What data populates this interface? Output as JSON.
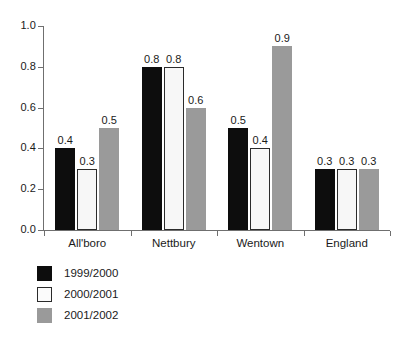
{
  "chart_data": {
    "type": "bar",
    "title": "",
    "xlabel": "",
    "ylabel": "",
    "ylim": [
      0.0,
      1.0
    ],
    "grid": false,
    "legend_position": "bottom-left",
    "categories": [
      "All'boro",
      "Nettbury",
      "Wentown",
      "England"
    ],
    "ytick_labels": [
      "0.0",
      "0.2",
      "0.4",
      "0.6",
      "0.8",
      "1.0"
    ],
    "ytick_values": [
      0.0,
      0.2,
      0.4,
      0.6,
      0.8,
      1.0
    ],
    "series": [
      {
        "name": "1999/2000",
        "color": "#0d0d0d",
        "values": [
          0.4,
          0.8,
          0.5,
          0.3
        ],
        "labels": [
          "0.4",
          "0.8",
          "0.5",
          "0.3"
        ]
      },
      {
        "name": "2000/2001",
        "color": "#f7f7f7",
        "values": [
          0.3,
          0.8,
          0.4,
          0.3
        ],
        "labels": [
          "0.3",
          "0.8",
          "0.4",
          "0.3"
        ]
      },
      {
        "name": "2001/2002",
        "color": "#9a9a9a",
        "values": [
          0.5,
          0.6,
          0.9,
          0.3
        ],
        "labels": [
          "0.5",
          "0.6",
          "0.9",
          "0.3"
        ]
      }
    ]
  },
  "legend": {
    "items": [
      {
        "label": "1999/2000",
        "swatch": "black-swatch"
      },
      {
        "label": "2000/2001",
        "swatch": "white-swatch"
      },
      {
        "label": "2001/2002",
        "swatch": "gray-swatch"
      }
    ]
  }
}
